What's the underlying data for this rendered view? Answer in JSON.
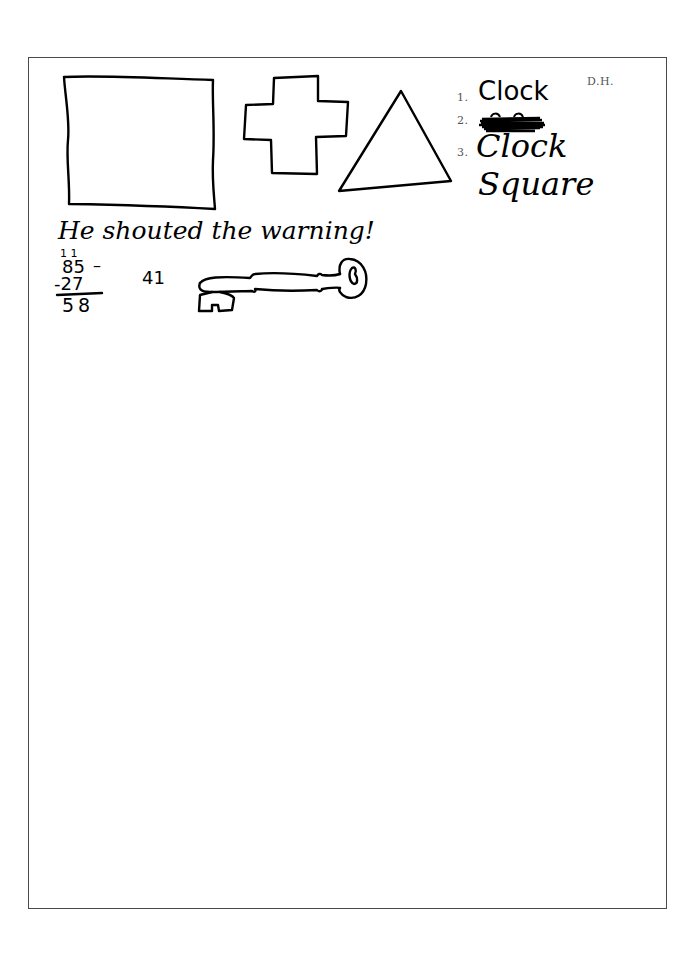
{
  "initials": "D.H.",
  "recall_list": {
    "items": [
      {
        "number": "1.",
        "text": "Clock",
        "style": "print"
      },
      {
        "number": "2.",
        "text": "",
        "style": "scribbled-out"
      },
      {
        "number": "3.",
        "text": "Clock",
        "style": "cursive"
      }
    ],
    "extra_word": "Square"
  },
  "drawings": {
    "shapes": [
      "square",
      "cross",
      "triangle",
      "key"
    ]
  },
  "sentence": "He shouted the warning!",
  "arithmetic": {
    "carry_marks": "1 1",
    "minuend": "85",
    "subtrahend": "-27",
    "result": "58",
    "dash": "–",
    "side_number": "41"
  }
}
